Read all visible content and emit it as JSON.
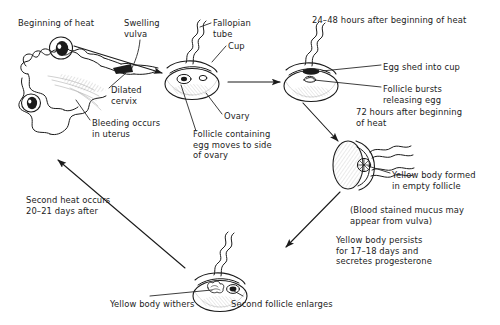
{
  "diagram": {
    "stroke_color": "#1b1b1b",
    "fill_color": "#ffffff",
    "shade_color": "#d8d8d8",
    "labels": [
      {
        "id": "beginning-of-heat",
        "text": "Beginning of heat",
        "x": 18,
        "y": 18,
        "align": "left"
      },
      {
        "id": "swelling-vulva",
        "text": "Swelling\nvulva",
        "x": 124,
        "y": 18,
        "align": "left"
      },
      {
        "id": "fallopian-tube",
        "text": "Fallopian\ntube",
        "x": 213,
        "y": 18,
        "align": "left"
      },
      {
        "id": "cup",
        "text": "Cup",
        "x": 228,
        "y": 41,
        "align": "left"
      },
      {
        "id": "hours-24-48",
        "text": "24–48 hours after beginning of heat",
        "x": 312,
        "y": 15,
        "align": "left"
      },
      {
        "id": "dilated-cervix",
        "text": "Dilated\ncervix",
        "x": 111,
        "y": 85,
        "align": "left"
      },
      {
        "id": "bleeding-in-uterus",
        "text": "Bleeding occurs\nin uterus",
        "x": 92,
        "y": 118,
        "align": "left"
      },
      {
        "id": "ovary",
        "text": "Ovary",
        "x": 224,
        "y": 111,
        "align": "left"
      },
      {
        "id": "follicle-containing-egg",
        "text": "Follicle containing\negg moves to side\nof ovary",
        "x": 193,
        "y": 129,
        "align": "left"
      },
      {
        "id": "egg-shed-into-cup",
        "text": "Egg shed into cup",
        "x": 383,
        "y": 62,
        "align": "left"
      },
      {
        "id": "follicle-bursts",
        "text": "Follicle bursts\nreleasing egg",
        "x": 383,
        "y": 84,
        "align": "left"
      },
      {
        "id": "hours-72",
        "text": "72 hours after beginning\nof heat",
        "x": 356,
        "y": 107,
        "align": "left"
      },
      {
        "id": "yellow-body-formed",
        "text": "Yellow body formed\nin empty follicle",
        "x": 392,
        "y": 170,
        "align": "left"
      },
      {
        "id": "blood-stained-mucus",
        "text": "(Blood stained mucus may\nappear from vulva)",
        "x": 350,
        "y": 205,
        "align": "left"
      },
      {
        "id": "yellow-body-persists",
        "text": "Yellow body persists\nfor 17–18 days and\nsecretes progesterone",
        "x": 336,
        "y": 235,
        "align": "left"
      },
      {
        "id": "second-heat-occurs",
        "text": "Second heat occurs\n20–21 days after",
        "x": 26,
        "y": 195,
        "align": "left"
      },
      {
        "id": "yellow-body-withers",
        "text": "Yellow body withers",
        "x": 110,
        "y": 299,
        "align": "left"
      },
      {
        "id": "second-follicle-enlarges",
        "text": "Second follicle enlarges",
        "x": 231,
        "y": 299,
        "align": "left"
      }
    ],
    "stages": [
      {
        "id": "stage-tract",
        "name": "Reproductive tract at beginning of heat"
      },
      {
        "id": "stage-ovary-follicle",
        "name": "Ovary with follicle containing egg"
      },
      {
        "id": "stage-ovary-ovulation",
        "name": "Ovary 24-48 hours, egg shed into cup"
      },
      {
        "id": "stage-ovary-corpus",
        "name": "Ovary 72 hours, yellow body in empty follicle"
      },
      {
        "id": "stage-ovary-regression",
        "name": "Ovary with yellow body withering and second follicle"
      }
    ],
    "flow_arrows": [
      {
        "id": "arrow-tract-to-ovary1",
        "from": "stage-tract",
        "to": "stage-ovary-follicle"
      },
      {
        "id": "arrow-ovary1-to-ovary2",
        "from": "stage-ovary-follicle",
        "to": "stage-ovary-ovulation"
      },
      {
        "id": "arrow-ovary2-to-ovary3",
        "from": "stage-ovary-ovulation",
        "to": "stage-ovary-corpus"
      },
      {
        "id": "arrow-ovary3-to-ovary4",
        "from": "stage-ovary-corpus",
        "to": "stage-ovary-regression"
      },
      {
        "id": "arrow-ovary4-to-tract",
        "from": "stage-ovary-regression",
        "to": "stage-tract"
      }
    ]
  }
}
